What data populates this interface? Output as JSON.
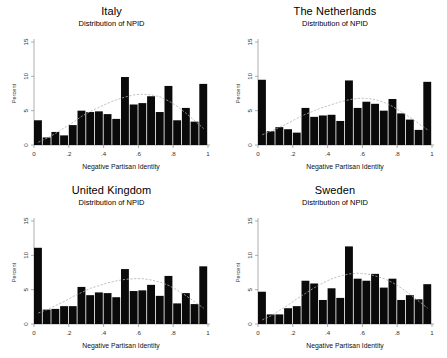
{
  "figure": {
    "width": 447,
    "height": 358,
    "background": "#ffffff",
    "bar_color": "#0a0a0a",
    "density_color": "#b0b0b0",
    "axis_color": "#8c8c8c"
  },
  "panels": [
    {
      "id": "italy",
      "title": "Italy",
      "subtitle": "Distribution of NPID"
    },
    {
      "id": "netherlands",
      "title": "The Netherlands",
      "subtitle": "Distribution of NPID"
    },
    {
      "id": "united-kingdom",
      "title": "United Kingdom",
      "subtitle": "Distribution of NPID"
    },
    {
      "id": "sweden",
      "title": "Sweden",
      "subtitle": "Distribution of NPID"
    }
  ],
  "chart_data": [
    {
      "type": "bar",
      "title": "Italy",
      "subtitle": "Distribution of NPID",
      "xlabel": "Negative Partisan Identity",
      "ylabel": "Percent",
      "xlim": [
        0,
        1
      ],
      "ylim": [
        0,
        15
      ],
      "xticks": [
        0,
        0.2,
        0.4,
        0.6,
        0.8,
        1
      ],
      "xticklabels": [
        "0",
        ".2",
        ".4",
        ".6",
        ".8",
        "1"
      ],
      "yticks": [
        0,
        5,
        10,
        15
      ],
      "yticklabels": [
        "0",
        "5",
        "10",
        "15"
      ],
      "grid": false,
      "legend": "none",
      "bin_width": 0.05,
      "bin_centers": [
        0.025,
        0.075,
        0.125,
        0.175,
        0.225,
        0.275,
        0.325,
        0.375,
        0.425,
        0.475,
        0.525,
        0.575,
        0.625,
        0.675,
        0.725,
        0.775,
        0.825,
        0.875,
        0.925,
        0.975
      ],
      "values": [
        3.6,
        1.1,
        1.9,
        1.4,
        2.9,
        5.0,
        4.8,
        4.9,
        4.5,
        3.8,
        9.9,
        5.9,
        6.1,
        7.1,
        4.8,
        8.6,
        3.6,
        5.4,
        3.4,
        8.9
      ],
      "overlay": {
        "name": "kernel density",
        "style": "dashed",
        "values": [
          0.4,
          1.0,
          1.7,
          2.5,
          3.3,
          4.2,
          4.9,
          5.5,
          6.1,
          6.6,
          7.0,
          7.3,
          7.4,
          7.3,
          7.0,
          6.4,
          5.6,
          4.6,
          3.5,
          2.4
        ]
      }
    },
    {
      "type": "bar",
      "title": "The Netherlands",
      "subtitle": "Distribution of NPID",
      "xlabel": "Negative Partisan Identity",
      "ylabel": "Percent",
      "xlim": [
        0,
        1
      ],
      "ylim": [
        0,
        15
      ],
      "xticks": [
        0,
        0.2,
        0.4,
        0.6,
        0.8,
        1
      ],
      "xticklabels": [
        "0",
        ".2",
        ".4",
        ".6",
        ".8",
        "1"
      ],
      "yticks": [
        0,
        5,
        10,
        15
      ],
      "yticklabels": [
        "0",
        "5",
        "10",
        "15"
      ],
      "grid": false,
      "legend": "none",
      "bin_width": 0.05,
      "bin_centers": [
        0.025,
        0.075,
        0.125,
        0.175,
        0.225,
        0.275,
        0.325,
        0.375,
        0.425,
        0.475,
        0.525,
        0.575,
        0.625,
        0.675,
        0.725,
        0.775,
        0.825,
        0.875,
        0.925,
        0.975
      ],
      "values": [
        9.5,
        2.0,
        2.6,
        2.3,
        1.8,
        5.4,
        4.1,
        4.3,
        4.4,
        3.5,
        9.4,
        5.4,
        6.3,
        6.0,
        5.0,
        6.7,
        4.6,
        3.7,
        2.2,
        9.2
      ],
      "overlay": {
        "name": "kernel density",
        "style": "dashed",
        "values": [
          1.5,
          2.0,
          2.6,
          3.2,
          3.9,
          4.5,
          5.0,
          5.5,
          5.9,
          6.3,
          6.6,
          6.8,
          6.8,
          6.6,
          6.2,
          5.6,
          4.8,
          4.0,
          3.1,
          2.2
        ]
      }
    },
    {
      "type": "bar",
      "title": "United Kingdom",
      "subtitle": "Distribution of NPID",
      "xlabel": "Negative Partisan Identity",
      "ylabel": "Percent",
      "xlim": [
        0,
        1
      ],
      "ylim": [
        0,
        15
      ],
      "xticks": [
        0,
        0.2,
        0.4,
        0.6,
        0.8,
        1
      ],
      "xticklabels": [
        "0",
        ".2",
        ".4",
        ".6",
        ".8",
        "1"
      ],
      "yticks": [
        0,
        5,
        10,
        15
      ],
      "yticklabels": [
        "0",
        "5",
        "10",
        "15"
      ],
      "grid": false,
      "legend": "none",
      "bin_width": 0.05,
      "bin_centers": [
        0.025,
        0.075,
        0.125,
        0.175,
        0.225,
        0.275,
        0.325,
        0.375,
        0.425,
        0.475,
        0.525,
        0.575,
        0.625,
        0.675,
        0.725,
        0.775,
        0.825,
        0.875,
        0.925,
        0.975
      ],
      "values": [
        11.1,
        2.1,
        2.2,
        2.6,
        2.6,
        5.4,
        4.2,
        4.6,
        4.5,
        3.9,
        8.0,
        4.8,
        4.9,
        5.7,
        4.1,
        7.0,
        3.0,
        4.5,
        2.9,
        8.4
      ],
      "overlay": {
        "name": "kernel density",
        "style": "dashed",
        "values": [
          1.6,
          2.1,
          2.7,
          3.3,
          4.0,
          4.6,
          5.2,
          5.6,
          6.0,
          6.3,
          6.5,
          6.6,
          6.6,
          6.4,
          6.1,
          5.6,
          4.9,
          4.1,
          3.2,
          2.3
        ]
      }
    },
    {
      "type": "bar",
      "title": "Sweden",
      "subtitle": "Distribution of NPID",
      "xlabel": "Negative Partisan Identity",
      "ylabel": "Percent",
      "xlim": [
        0,
        1
      ],
      "ylim": [
        0,
        15
      ],
      "xticks": [
        0,
        0.2,
        0.4,
        0.6,
        0.8,
        1
      ],
      "xticklabels": [
        "0",
        ".2",
        ".4",
        ".6",
        ".8",
        "1"
      ],
      "yticks": [
        0,
        5,
        10,
        15
      ],
      "yticklabels": [
        "0",
        "5",
        "10",
        "15"
      ],
      "grid": false,
      "legend": "none",
      "bin_width": 0.05,
      "bin_centers": [
        0.025,
        0.075,
        0.125,
        0.175,
        0.225,
        0.275,
        0.325,
        0.375,
        0.425,
        0.475,
        0.525,
        0.575,
        0.625,
        0.675,
        0.725,
        0.775,
        0.825,
        0.875,
        0.925,
        0.975
      ],
      "values": [
        4.7,
        1.4,
        1.4,
        2.3,
        2.6,
        6.3,
        5.9,
        3.5,
        5.2,
        3.8,
        11.3,
        6.6,
        6.3,
        7.3,
        5.3,
        6.6,
        3.5,
        4.2,
        3.6,
        5.8
      ],
      "overlay": {
        "name": "kernel density",
        "style": "dashed",
        "values": [
          0.6,
          1.2,
          2.0,
          2.8,
          3.7,
          4.5,
          5.3,
          6.0,
          6.6,
          7.0,
          7.3,
          7.4,
          7.3,
          7.0,
          6.6,
          6.0,
          5.2,
          4.3,
          3.3,
          2.3
        ]
      }
    }
  ]
}
